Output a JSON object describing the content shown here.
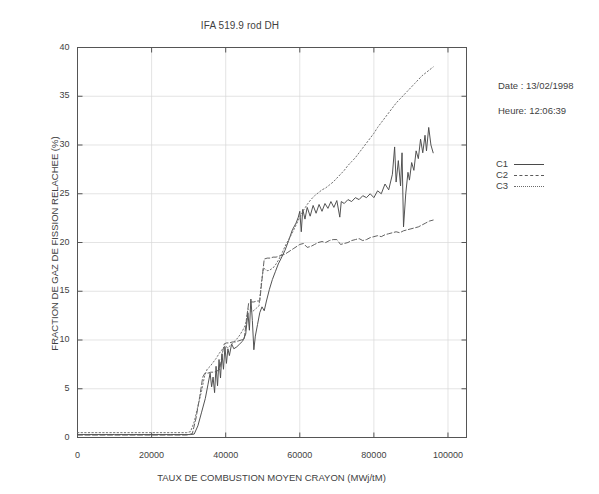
{
  "chart_data": {
    "type": "line",
    "title": "IFA 519.9 rod DH",
    "xlabel": "TAUX DE COMBUSTION MOYEN CRAYON (MWj/tM)",
    "ylabel": "FRACTION DE GAZ DE FISSION RELACHEE (%)",
    "xlim": [
      0,
      105000
    ],
    "ylim": [
      0,
      40
    ],
    "xticks": [
      0,
      20000,
      40000,
      60000,
      80000,
      100000
    ],
    "xticklabels": [
      "0",
      "20000",
      "40000",
      "60000",
      "80000",
      "100000"
    ],
    "yticks": [
      0,
      5,
      10,
      15,
      20,
      25,
      30,
      35,
      40
    ],
    "yticklabels": [
      "0",
      "5",
      "10",
      "15",
      "20",
      "25",
      "30",
      "35",
      "40"
    ],
    "grid": true,
    "legend_position": "right-outside",
    "series": [
      {
        "name": "C1",
        "style": "solid",
        "color": "#4a4a4a",
        "points": [
          [
            0,
            0.3
          ],
          [
            5000,
            0.3
          ],
          [
            10000,
            0.3
          ],
          [
            15000,
            0.3
          ],
          [
            20000,
            0.3
          ],
          [
            25000,
            0.3
          ],
          [
            29000,
            0.3
          ],
          [
            30500,
            0.3
          ],
          [
            31500,
            0.35
          ],
          [
            32500,
            1.2
          ],
          [
            33500,
            2.6
          ],
          [
            34500,
            4.0
          ],
          [
            35200,
            5.4
          ],
          [
            35800,
            6.6
          ],
          [
            36200,
            5.2
          ],
          [
            36600,
            6.2
          ],
          [
            37000,
            4.6
          ],
          [
            37400,
            7.3
          ],
          [
            37800,
            5.3
          ],
          [
            38200,
            8.0
          ],
          [
            38600,
            6.1
          ],
          [
            39000,
            8.6
          ],
          [
            39400,
            7.0
          ],
          [
            39800,
            9.3
          ],
          [
            40200,
            7.6
          ],
          [
            40600,
            9.1
          ],
          [
            41000,
            8.4
          ],
          [
            41600,
            9.6
          ],
          [
            42200,
            9.1
          ],
          [
            43000,
            9.3
          ],
          [
            43800,
            9.6
          ],
          [
            44600,
            9.9
          ],
          [
            45400,
            10.6
          ],
          [
            46000,
            12.8
          ],
          [
            46400,
            11.0
          ],
          [
            46800,
            14.2
          ],
          [
            47200,
            12.0
          ],
          [
            47600,
            9.0
          ],
          [
            48000,
            10.4
          ],
          [
            48600,
            11.6
          ],
          [
            49200,
            12.8
          ],
          [
            49800,
            13.4
          ],
          [
            50400,
            13.0
          ],
          [
            51000,
            14.0
          ],
          [
            51800,
            15.2
          ],
          [
            52600,
            16.2
          ],
          [
            53400,
            17.0
          ],
          [
            54200,
            17.8
          ],
          [
            55000,
            18.4
          ],
          [
            56000,
            19.2
          ],
          [
            57000,
            20.2
          ],
          [
            58000,
            21.3
          ],
          [
            59000,
            22.0
          ],
          [
            59600,
            22.6
          ],
          [
            60000,
            23.2
          ],
          [
            60400,
            21.1
          ],
          [
            60800,
            23.4
          ],
          [
            61400,
            22.4
          ],
          [
            62000,
            23.6
          ],
          [
            62800,
            22.7
          ],
          [
            63600,
            23.8
          ],
          [
            64400,
            23.0
          ],
          [
            65200,
            23.9
          ],
          [
            66000,
            23.2
          ],
          [
            66800,
            24.0
          ],
          [
            67600,
            23.5
          ],
          [
            68400,
            24.2
          ],
          [
            69200,
            23.6
          ],
          [
            70000,
            24.3
          ],
          [
            70800,
            22.6
          ],
          [
            71200,
            24.2
          ],
          [
            72000,
            24.0
          ],
          [
            73000,
            24.4
          ],
          [
            74000,
            24.2
          ],
          [
            75000,
            24.6
          ],
          [
            76000,
            24.4
          ],
          [
            77000,
            24.8
          ],
          [
            78000,
            24.6
          ],
          [
            79000,
            25.0
          ],
          [
            80000,
            24.6
          ],
          [
            81000,
            25.3
          ],
          [
            82000,
            25.0
          ],
          [
            83000,
            26.0
          ],
          [
            84000,
            25.4
          ],
          [
            85000,
            27.0
          ],
          [
            85600,
            29.8
          ],
          [
            86000,
            26.2
          ],
          [
            86600,
            28.4
          ],
          [
            87200,
            25.8
          ],
          [
            87600,
            29.2
          ],
          [
            88000,
            21.6
          ],
          [
            88600,
            25.0
          ],
          [
            89200,
            27.2
          ],
          [
            89600,
            26.4
          ],
          [
            90200,
            28.2
          ],
          [
            90800,
            27.4
          ],
          [
            91400,
            29.4
          ],
          [
            92000,
            28.6
          ],
          [
            92600,
            30.6
          ],
          [
            93200,
            29.2
          ],
          [
            93800,
            31.0
          ],
          [
            94200,
            29.4
          ],
          [
            94800,
            31.8
          ],
          [
            95400,
            30.0
          ],
          [
            96000,
            29.2
          ]
        ]
      },
      {
        "name": "C2",
        "style": "dashed",
        "color": "#5a5a5a",
        "points": [
          [
            0,
            0.25
          ],
          [
            8000,
            0.25
          ],
          [
            16000,
            0.25
          ],
          [
            24000,
            0.25
          ],
          [
            29500,
            0.25
          ],
          [
            31000,
            0.4
          ],
          [
            32000,
            2.0
          ],
          [
            33000,
            4.2
          ],
          [
            33800,
            6.2
          ],
          [
            34400,
            6.6
          ],
          [
            35200,
            6.6
          ],
          [
            36000,
            6.7
          ],
          [
            36800,
            6.7
          ],
          [
            37600,
            6.8
          ],
          [
            38400,
            7.0
          ],
          [
            39000,
            8.4
          ],
          [
            39600,
            9.6
          ],
          [
            40200,
            9.7
          ],
          [
            41000,
            9.7
          ],
          [
            41800,
            9.8
          ],
          [
            42600,
            9.8
          ],
          [
            43400,
            9.9
          ],
          [
            44200,
            10.0
          ],
          [
            45000,
            10.1
          ],
          [
            45600,
            12.0
          ],
          [
            46200,
            13.8
          ],
          [
            46800,
            13.9
          ],
          [
            47600,
            13.9
          ],
          [
            48400,
            14.0
          ],
          [
            49200,
            14.0
          ],
          [
            49800,
            16.2
          ],
          [
            50400,
            18.3
          ],
          [
            51200,
            18.4
          ],
          [
            52000,
            18.4
          ],
          [
            52800,
            18.5
          ],
          [
            53600,
            18.5
          ],
          [
            54400,
            18.6
          ],
          [
            55200,
            18.7
          ],
          [
            56000,
            18.8
          ],
          [
            56800,
            19.0
          ],
          [
            57600,
            19.2
          ],
          [
            58400,
            19.4
          ],
          [
            59200,
            19.6
          ],
          [
            60000,
            19.8
          ],
          [
            61000,
            19.9
          ],
          [
            62000,
            19.5
          ],
          [
            63000,
            19.6
          ],
          [
            64000,
            19.8
          ],
          [
            65000,
            20.0
          ],
          [
            66000,
            20.1
          ],
          [
            67000,
            20.0
          ],
          [
            68000,
            20.2
          ],
          [
            69000,
            20.3
          ],
          [
            70000,
            20.3
          ],
          [
            71000,
            19.8
          ],
          [
            72000,
            19.9
          ],
          [
            73000,
            20.0
          ],
          [
            74000,
            20.2
          ],
          [
            75000,
            20.3
          ],
          [
            76000,
            20.4
          ],
          [
            77000,
            20.2
          ],
          [
            78000,
            20.3
          ],
          [
            79000,
            20.5
          ],
          [
            80000,
            20.6
          ],
          [
            81000,
            20.7
          ],
          [
            82000,
            20.6
          ],
          [
            83000,
            20.8
          ],
          [
            84000,
            20.9
          ],
          [
            85000,
            21.0
          ],
          [
            86000,
            21.1
          ],
          [
            87000,
            21.0
          ],
          [
            88000,
            21.2
          ],
          [
            89000,
            21.3
          ],
          [
            90000,
            21.4
          ],
          [
            91000,
            21.5
          ],
          [
            92000,
            21.6
          ],
          [
            93000,
            21.8
          ],
          [
            94000,
            22.0
          ],
          [
            95000,
            22.2
          ],
          [
            96000,
            22.3
          ]
        ]
      },
      {
        "name": "C3",
        "style": "dotted",
        "color": "#6a6a6a",
        "points": [
          [
            0,
            0.5
          ],
          [
            8000,
            0.5
          ],
          [
            16000,
            0.5
          ],
          [
            24000,
            0.5
          ],
          [
            29500,
            0.5
          ],
          [
            30500,
            0.6
          ],
          [
            31500,
            1.6
          ],
          [
            32500,
            3.2
          ],
          [
            33500,
            4.8
          ],
          [
            34300,
            6.3
          ],
          [
            35000,
            7.0
          ],
          [
            35800,
            7.3
          ],
          [
            36600,
            7.7
          ],
          [
            37400,
            8.1
          ],
          [
            38200,
            8.6
          ],
          [
            39000,
            9.0
          ],
          [
            39800,
            9.4
          ],
          [
            40600,
            9.2
          ],
          [
            41400,
            9.5
          ],
          [
            42200,
            9.8
          ],
          [
            43000,
            10.1
          ],
          [
            43800,
            10.5
          ],
          [
            44600,
            11.0
          ],
          [
            45400,
            11.6
          ],
          [
            46000,
            13.2
          ],
          [
            46600,
            13.0
          ],
          [
            47200,
            12.9
          ],
          [
            47800,
            13.1
          ],
          [
            48400,
            13.3
          ],
          [
            49000,
            13.5
          ],
          [
            49600,
            15.8
          ],
          [
            50200,
            17.4
          ],
          [
            50800,
            17.2
          ],
          [
            51400,
            17.1
          ],
          [
            52000,
            17.2
          ],
          [
            52800,
            17.4
          ],
          [
            53600,
            17.8
          ],
          [
            54400,
            18.3
          ],
          [
            55200,
            18.9
          ],
          [
            56000,
            19.6
          ],
          [
            57000,
            20.3
          ],
          [
            58000,
            21.0
          ],
          [
            59000,
            21.8
          ],
          [
            60000,
            22.6
          ],
          [
            61000,
            23.3
          ],
          [
            62000,
            23.9
          ],
          [
            63000,
            24.4
          ],
          [
            64000,
            24.8
          ],
          [
            65000,
            25.1
          ],
          [
            66000,
            25.4
          ],
          [
            67000,
            25.6
          ],
          [
            68000,
            25.9
          ],
          [
            69000,
            26.2
          ],
          [
            70000,
            26.6
          ],
          [
            71000,
            27.0
          ],
          [
            72000,
            27.4
          ],
          [
            73000,
            27.9
          ],
          [
            74000,
            28.3
          ],
          [
            75000,
            28.7
          ],
          [
            76000,
            29.2
          ],
          [
            77000,
            29.7
          ],
          [
            78000,
            30.2
          ],
          [
            79000,
            30.7
          ],
          [
            80000,
            31.2
          ],
          [
            81000,
            31.8
          ],
          [
            82000,
            32.3
          ],
          [
            83000,
            32.8
          ],
          [
            84000,
            33.3
          ],
          [
            85000,
            33.8
          ],
          [
            86000,
            34.3
          ],
          [
            87000,
            34.7
          ],
          [
            88000,
            35.1
          ],
          [
            89000,
            35.5
          ],
          [
            90000,
            35.9
          ],
          [
            91000,
            36.3
          ],
          [
            92000,
            36.7
          ],
          [
            93000,
            37.1
          ],
          [
            94000,
            37.4
          ],
          [
            95000,
            37.7
          ],
          [
            96000,
            38.0
          ]
        ]
      }
    ]
  },
  "annotations": {
    "date_label": "Date : 13/02/1998",
    "time_label": "Heure: 12:06:39"
  },
  "legend": {
    "entries": [
      {
        "label": "C1"
      },
      {
        "label": "C2"
      },
      {
        "label": "C3"
      }
    ]
  }
}
